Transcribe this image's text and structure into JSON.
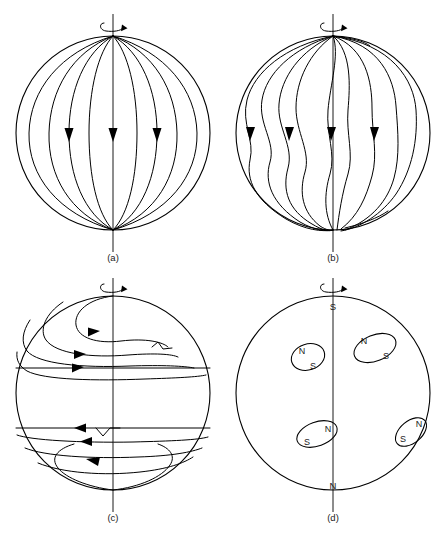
{
  "figure": {
    "name": "solar-dynamo-sequence",
    "background_color": "#ffffff",
    "line_color": "#000000",
    "text_color": "#1a1a1a",
    "width": 447,
    "height": 545
  },
  "panels": [
    {
      "id": "a",
      "caption": "(a)",
      "description": "poloidal-dipole-field",
      "center_x": 113,
      "center_y": 133,
      "radius": 97,
      "rotation_symbol": "rotation-arrow",
      "field_line_count": 9,
      "arrow_count": 3,
      "arrow_direction": "down",
      "pole_labels": []
    },
    {
      "id": "b",
      "caption": "(b)",
      "description": "field-lines-distorted-by-differential-rotation",
      "center_x": 333,
      "center_y": 133,
      "radius": 97,
      "rotation_symbol": "rotation-arrow",
      "field_line_count": 9,
      "arrow_count": 4,
      "arrow_direction": "down",
      "pole_labels": []
    },
    {
      "id": "c",
      "caption": "(c)",
      "description": "toroidal-field-wound-into-bands-with-kinks",
      "center_x": 113,
      "center_y": 393,
      "radius": 97,
      "rotation_symbol": "rotation-arrow",
      "north_arrow_direction": "right",
      "south_arrow_direction": "left",
      "kink_count": 2,
      "pole_labels": []
    },
    {
      "id": "d",
      "caption": "(d)",
      "description": "sunspot-pairs-with-opposite-polarity-by-hemisphere",
      "center_x": 333,
      "center_y": 393,
      "radius": 97,
      "rotation_symbol": "rotation-arrow",
      "pole_labels": [
        {
          "name": "north-pole-label",
          "text": "S",
          "x": 333,
          "y": 307
        },
        {
          "name": "south-pole-label",
          "text": "N",
          "x": 333,
          "y": 489
        }
      ],
      "spots": [
        {
          "name": "spot-pair-upper-left",
          "cx": 308,
          "cy": 357,
          "rx": 17,
          "ry": 13,
          "rotate": -18,
          "leading": {
            "text": "N",
            "x": 302,
            "y": 351
          },
          "trailing": {
            "text": "S",
            "x": 312,
            "y": 366
          }
        },
        {
          "name": "spot-pair-upper-right",
          "cx": 375,
          "cy": 348,
          "rx": 22,
          "ry": 13,
          "rotate": -22,
          "leading": {
            "text": "N",
            "x": 363,
            "y": 342
          },
          "trailing": {
            "text": "S",
            "x": 385,
            "y": 356
          }
        },
        {
          "name": "spot-pair-lower-left",
          "cx": 317,
          "cy": 434,
          "rx": 21,
          "ry": 12,
          "rotate": -20,
          "leading": {
            "text": "N",
            "x": 327,
            "y": 429
          },
          "trailing": {
            "text": "S",
            "x": 307,
            "y": 442
          }
        },
        {
          "name": "spot-pair-lower-right",
          "cx": 411,
          "cy": 432,
          "rx": 18,
          "ry": 11,
          "rotate": -40,
          "leading": {
            "text": "N",
            "x": 418,
            "y": 424
          },
          "trailing": {
            "text": "S",
            "x": 403,
            "y": 439
          }
        }
      ]
    }
  ],
  "captions": {
    "a": "(a)",
    "b": "(b)",
    "c": "(c)",
    "d": "(d)"
  },
  "labels": {
    "north_polarity": "N",
    "south_polarity": "S",
    "panel_d_top_pole": "S",
    "panel_d_bottom_pole": "N"
  }
}
